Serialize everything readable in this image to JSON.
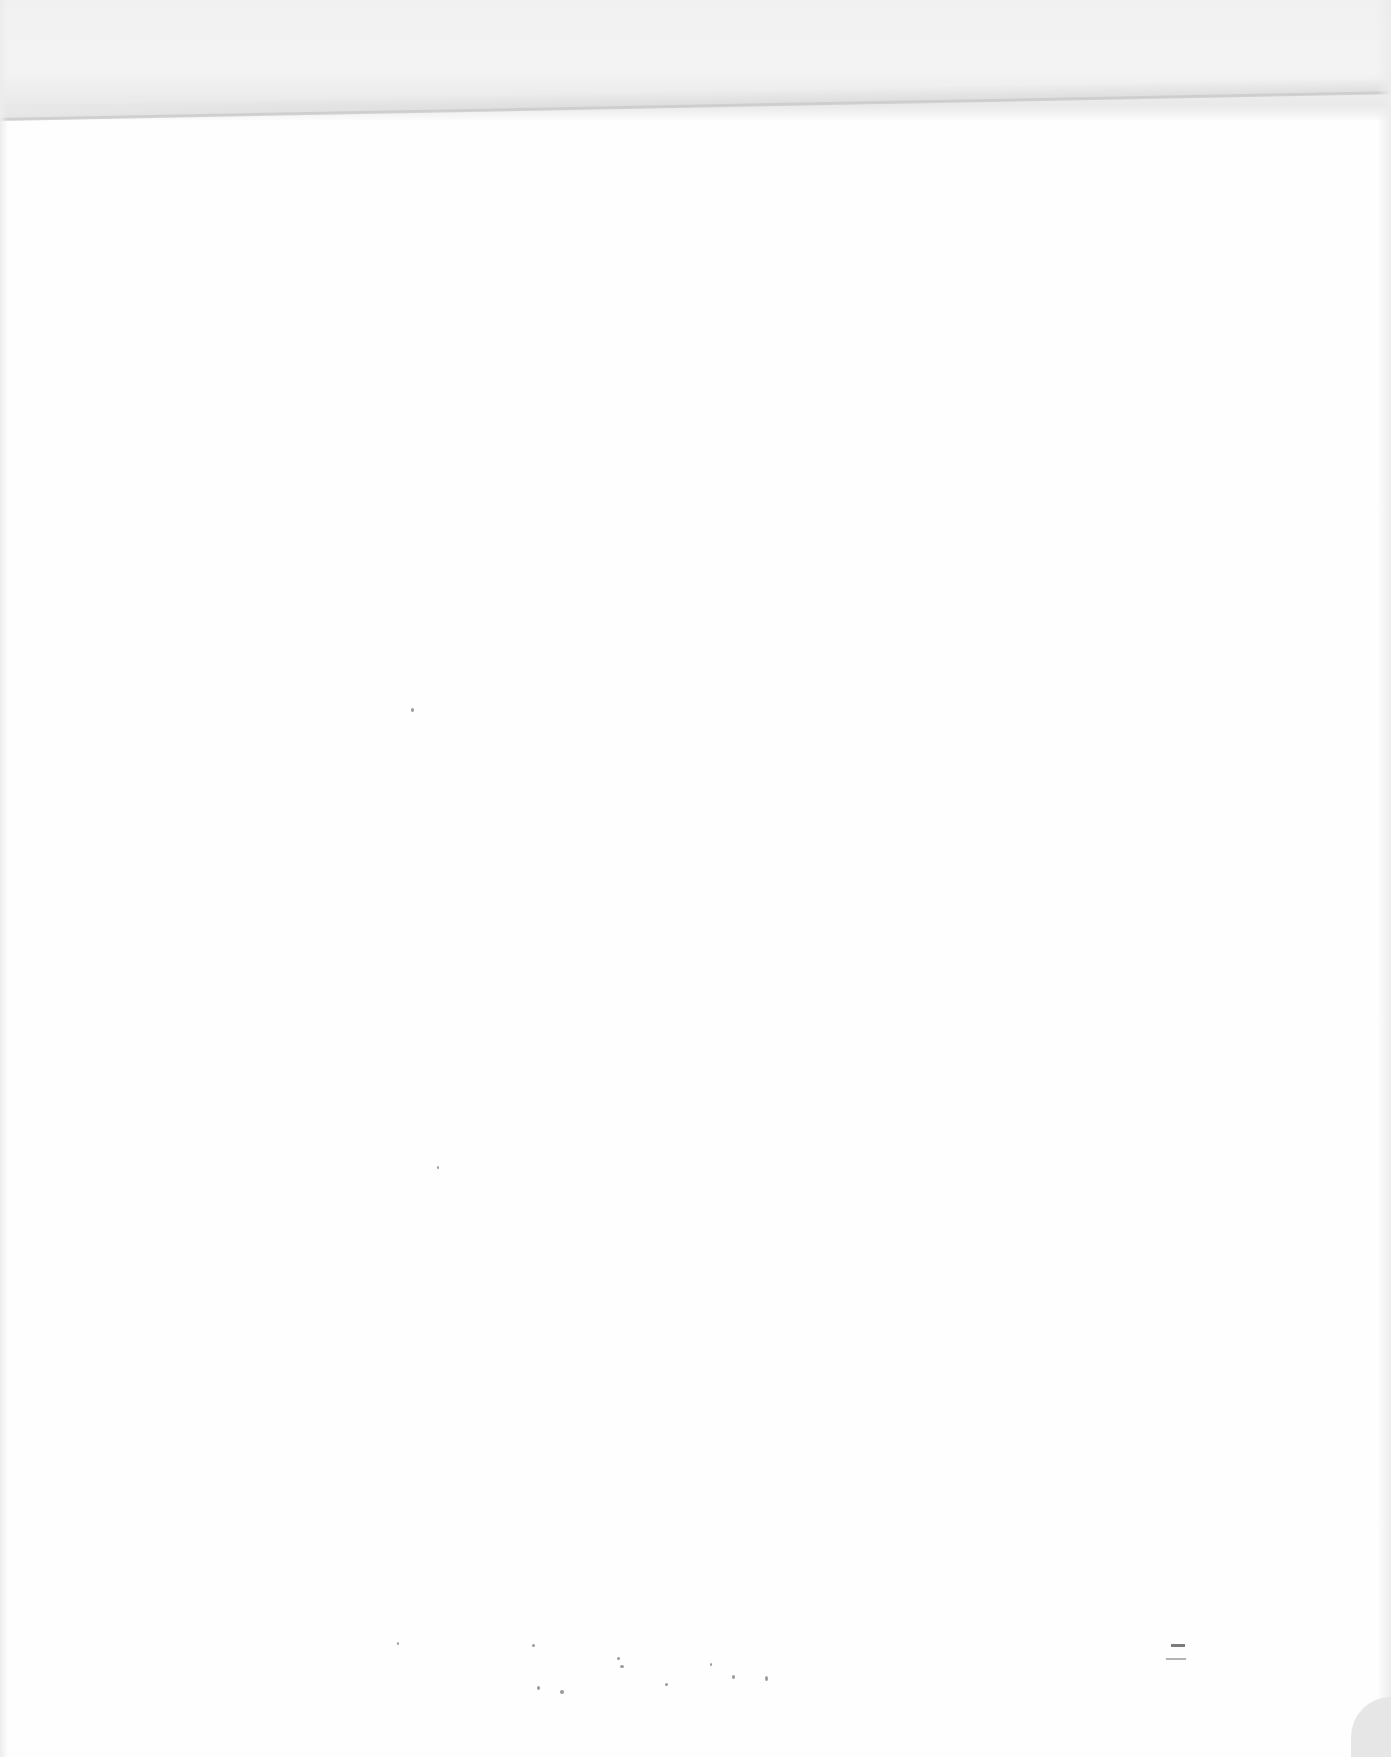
{
  "document": {
    "type": "scanned-blank-page",
    "text_content": "",
    "background_color": "#fefefe",
    "crease_color": "#c9c9c9"
  }
}
